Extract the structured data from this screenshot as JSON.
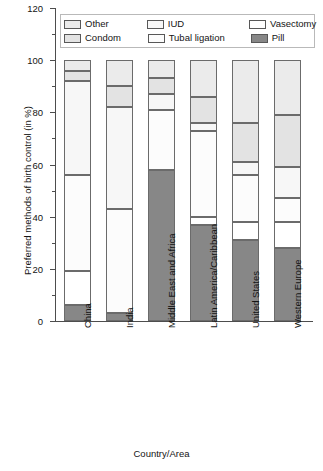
{
  "chart_data": {
    "type": "bar",
    "subtype": "stacked-bar",
    "title": "",
    "xlabel": "Country/Area",
    "ylabel": "Preferred methods of birth control (in %)",
    "ylim": [
      0,
      120
    ],
    "yticks": [
      0,
      20,
      40,
      60,
      80,
      100,
      120
    ],
    "ytick_labels": [
      "0",
      "20",
      "40",
      "60",
      "80",
      "100",
      "120"
    ],
    "minor_ticks": [
      10,
      30,
      50,
      70,
      90,
      110
    ],
    "grid": false,
    "legend_position": "top",
    "stack_order_bottom_to_top": [
      "Pill",
      "Vasectomy",
      "Tubal ligation",
      "IUD",
      "Condom",
      "Other"
    ],
    "categories": [
      "China",
      "India",
      "Middle East and Africa",
      "Latin America/Caribbean",
      "United States",
      "Western Europe"
    ],
    "series": [
      {
        "name": "Pill",
        "color": "#878787",
        "values": [
          6,
          3,
          58,
          37,
          31,
          28
        ]
      },
      {
        "name": "Vasectomy",
        "color": "#ffffff",
        "values": [
          13,
          0,
          0,
          3,
          7,
          10
        ]
      },
      {
        "name": "Tubal ligation",
        "color": "#fcfcfc",
        "values": [
          37,
          40,
          23,
          33,
          18,
          9
        ]
      },
      {
        "name": "IUD",
        "color": "#f7f7f7",
        "values": [
          36,
          39,
          6,
          3,
          5,
          12
        ]
      },
      {
        "name": "Condom",
        "color": "#e3e3e3",
        "values": [
          4,
          8,
          6,
          10,
          15,
          20
        ]
      },
      {
        "name": "Other",
        "color": "#ebebeb",
        "values": [
          4,
          10,
          7,
          14,
          24,
          21
        ]
      }
    ],
    "legend_entries": [
      {
        "label": "Other",
        "color": "#ebebeb"
      },
      {
        "label": "IUD",
        "color": "#f7f7f7"
      },
      {
        "label": "Vasectomy",
        "color": "#ffffff"
      },
      {
        "label": "Condom",
        "color": "#e3e3e3"
      },
      {
        "label": "Tubal ligation",
        "color": "#fcfcfc"
      },
      {
        "label": "Pill",
        "color": "#878787"
      }
    ]
  }
}
